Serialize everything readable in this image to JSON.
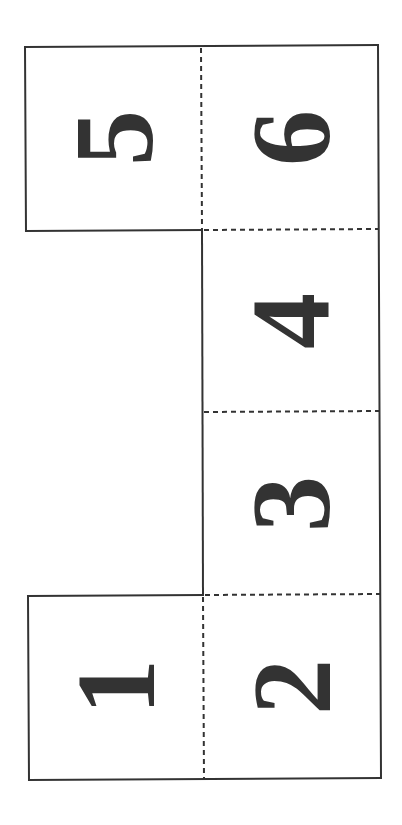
{
  "diagram": {
    "type": "cube-net",
    "colors": {
      "outline": "#333333",
      "fold_line": "#333333",
      "digit": "#333333",
      "background": "#ffffff"
    },
    "faces": [
      {
        "id": "face-5",
        "label": "5",
        "column": "left",
        "row": 1
      },
      {
        "id": "face-6",
        "label": "6",
        "column": "right",
        "row": 1
      },
      {
        "id": "face-4",
        "label": "4",
        "column": "right",
        "row": 2
      },
      {
        "id": "face-3",
        "label": "3",
        "column": "right",
        "row": 3
      },
      {
        "id": "face-1",
        "label": "1",
        "column": "left",
        "row": 4
      },
      {
        "id": "face-2",
        "label": "2",
        "column": "right",
        "row": 4
      }
    ],
    "digit_orientation": "rotated 90 degrees counterclockwise",
    "legend": {
      "solid_line": "cut / outline",
      "dashed_line": "fold"
    }
  }
}
